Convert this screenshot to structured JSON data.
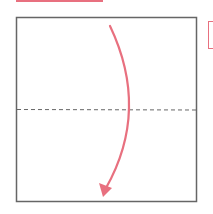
{
  "diagram": {
    "type": "origami-fold-step",
    "colors": {
      "accent": "#e8707f",
      "square_border": "#666666",
      "fold_line": "#666666",
      "background": "#ffffff"
    },
    "square": {
      "x": 16,
      "y": 17,
      "width": 180,
      "height": 185
    },
    "fold_line": {
      "style": "dashed",
      "y": 109,
      "x1": 16,
      "x2": 196
    },
    "arrow": {
      "direction": "down",
      "start": [
        110,
        26
      ],
      "control": [
        150,
        110
      ],
      "end": [
        104,
        196
      ]
    },
    "decorations": [
      "top-left-accent-bar",
      "right-edge-bracket"
    ]
  }
}
